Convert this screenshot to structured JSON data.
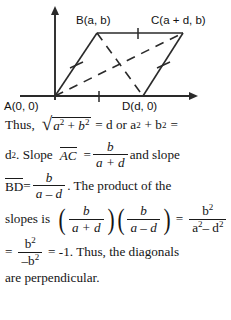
{
  "figure": {
    "vertex_labels": {
      "a": "A(0, 0)",
      "b": "B(a, b)",
      "c": "C(a + d, b)",
      "d": "D(d, 0)"
    },
    "axes": {
      "x_axis": "horizontal-axis-with-arrow",
      "y_axis": "vertical-axis-with-arrow"
    },
    "sides": [
      "AB",
      "BC",
      "CD",
      "DA"
    ],
    "diagonals": [
      "AC",
      "BD"
    ],
    "diagonal_style": "dashed",
    "tick_marks": 4,
    "stroke_color": "#2a2a2a"
  },
  "prose": {
    "line1": {
      "thus": "Thus,",
      "radicand_a": "a",
      "exp2_a": "2",
      "plus": "+",
      "radicand_b": "b",
      "exp2_b": "2",
      "eq1": "= d or a",
      "exp2_c": "2",
      "plus2": "+ b",
      "exp2_d": "2",
      "eq2": "="
    },
    "line2": {
      "d": "d",
      "exp2": "2",
      "period_slope": ". Slope",
      "segment_ac": "AC",
      "equals": "=",
      "num": "b",
      "den": "a + d",
      "tail": "and slope"
    },
    "line3": {
      "segment_bd": "BD",
      "equals": "=",
      "num": "b",
      "den": "a – d",
      "tail": ". The product of the"
    },
    "line4": {
      "lead": "slopes is",
      "f1_num": "b",
      "f1_den": "a + d",
      "f2_num": "b",
      "f2_den": "a – d",
      "equals": "=",
      "f3_num": "b",
      "f3_num_exp": "2",
      "f3_den_a": "a",
      "f3_den_a_exp": "2",
      "f3_den_mid": "– d",
      "f3_den_d_exp": "2"
    },
    "line5": {
      "equals1": "=",
      "num": "b",
      "num_exp": "2",
      "den": "–b",
      "den_exp": "2",
      "equals2": "= -1.  Thus, the diagonals"
    },
    "line6": {
      "text": "are perpendicular."
    }
  },
  "colors": {
    "ink": "#1a1a1a",
    "figure_stroke": "#2a2a2a",
    "background": "#ffffff"
  }
}
